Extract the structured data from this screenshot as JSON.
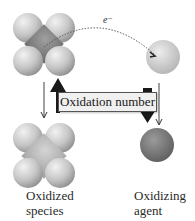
{
  "diagram": {
    "electron_label": "e⁻",
    "center_label": "Oxidation number",
    "left_caption_line1": "Oxidized",
    "left_caption_line2": "species",
    "right_caption_line1": "Oxidizing",
    "right_caption_line2": "agent",
    "colors": {
      "sphere_light": "#d6d6d6",
      "sphere_mid": "#a8a8a8",
      "sphere_dark": "#7a7a7a",
      "arrow_fill": "#1a1a1a",
      "label_bg": "#f0f0f0"
    }
  }
}
